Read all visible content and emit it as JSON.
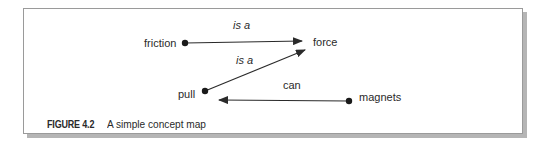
{
  "figure": {
    "number_label": "FIGURE 4.2",
    "caption": "A simple concept map"
  },
  "nodes": [
    {
      "id": "friction",
      "label": "friction"
    },
    {
      "id": "force",
      "label": "force"
    },
    {
      "id": "pull",
      "label": "pull"
    },
    {
      "id": "magnets",
      "label": "magnets"
    }
  ],
  "edges": [
    {
      "from": "friction",
      "to": "force",
      "label": "is a",
      "italic": true
    },
    {
      "from": "pull",
      "to": "force",
      "label": "is a",
      "italic": true
    },
    {
      "from": "magnets",
      "to": "pull",
      "label": "can",
      "italic": false
    }
  ],
  "colors": {
    "ink": "#2a2a2a",
    "frame_border": "#9a9a9a",
    "frame_shadow": "#b5b5b5",
    "background": "#ffffff"
  }
}
